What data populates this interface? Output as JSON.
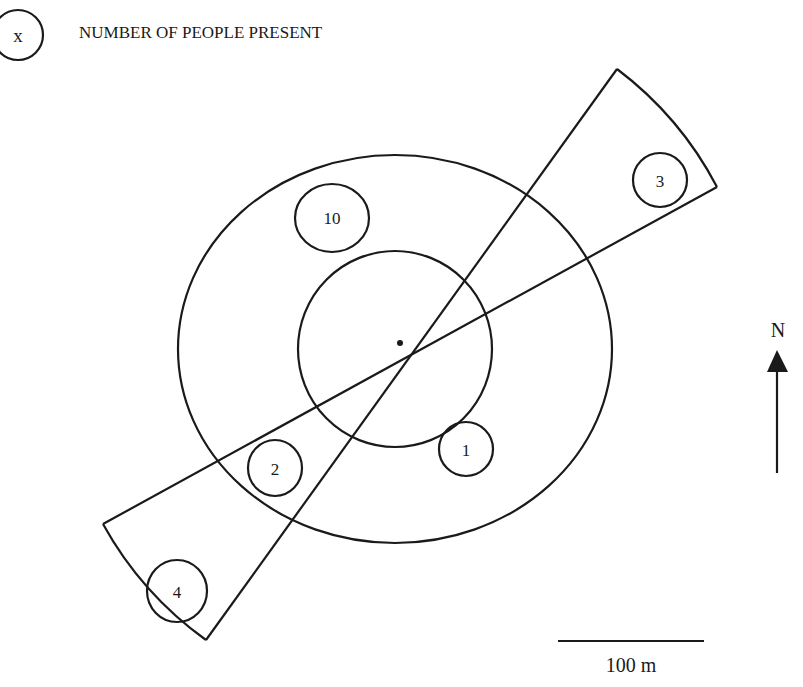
{
  "legend": {
    "symbol": "x",
    "text": "NUMBER OF PEOPLE PRESENT"
  },
  "zones": {
    "inner_circle": "inner zone",
    "outer_circle": "outer zone",
    "sector": "downwind beam sector"
  },
  "groups": [
    {
      "id": "group-10",
      "count": "10"
    },
    {
      "id": "group-1",
      "count": "1"
    },
    {
      "id": "group-2",
      "count": "2"
    },
    {
      "id": "group-3",
      "count": "3"
    },
    {
      "id": "group-4",
      "count": "4"
    }
  ],
  "north_arrow": {
    "label": "N"
  },
  "scale_bar": {
    "label": "100 m"
  },
  "colors": {
    "ink": "#1a1a1a",
    "background": "#ffffff"
  }
}
